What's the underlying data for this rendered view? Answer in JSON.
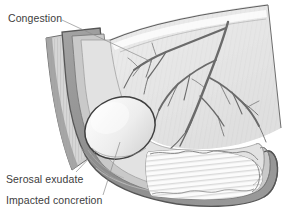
{
  "figure": {
    "width": 290,
    "height": 221,
    "background_color": "#ffffff"
  },
  "labels": [
    {
      "id": "congestion",
      "text": "Congestion",
      "x": 8,
      "y": 22,
      "leader_path": "M62,20 L152,62",
      "target": "mesoappendiceal-vessels"
    },
    {
      "id": "serosal-exudate",
      "text": "Serosal exudate",
      "x": 6,
      "y": 183,
      "leader_path": "M76,172 L96,151",
      "target": "appendix-serosa"
    },
    {
      "id": "impacted-concretion",
      "text": "Impacted concretion",
      "x": 6,
      "y": 204,
      "leader_path": "M103,195 L120,142",
      "target": "fecalith"
    }
  ],
  "colors": {
    "outline": "#5f5f5f",
    "serosa": "#8f8f8f",
    "muscularis": "#cfcfcf",
    "submucosa": "#dedede",
    "mucosa": "#f2f2f2",
    "lumen": "#ffffff",
    "meso_fill": "#e4e4e4",
    "vessel": "#6a6a6a",
    "concretion_fill": "#ededed",
    "concretion_outline": "#4a4a4a",
    "text": "#3d3d3d",
    "leader": "#8d8d8d"
  },
  "anatomy": {
    "parts": [
      {
        "name": "mesoappendix",
        "description": "Fan-shaped fold of peritoneum with cut superior edge"
      },
      {
        "name": "appendiceal-artery-tree",
        "description": "Branching congested vessels across mesoappendix"
      },
      {
        "name": "appendix-wall-layers",
        "description": "Concentric serosa, muscularis, submucosa, mucosa"
      },
      {
        "name": "appendiceal-lumen",
        "description": "Distal lumen with mucosal plicae"
      },
      {
        "name": "fecalith",
        "description": "Large pale ovoid concretion impacted in proximal lumen"
      },
      {
        "name": "cecum-junction",
        "description": "Proximal striated bowel wall at upper left"
      }
    ]
  }
}
